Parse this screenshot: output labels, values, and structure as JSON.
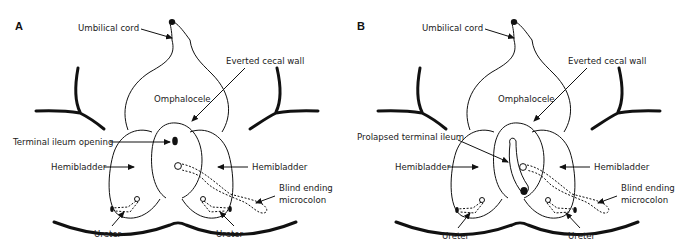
{
  "figure": {
    "type": "anatomical-diagram",
    "panels": [
      {
        "letter": "A",
        "labels": {
          "umbilical_cord": "Umbilical cord",
          "everted_cecal_wall": "Everted cecal wall",
          "omphalocele": "Omphalocele",
          "center_feature": "Terminal ileum opening",
          "hemibladder_left": "Hemibladder",
          "hemibladder_right": "Hemibladder",
          "blind_ending_1": "Blind ending",
          "blind_ending_2": "microcolon",
          "ureter_left": "Ureter",
          "ureter_right": "Ureter"
        }
      },
      {
        "letter": "B",
        "labels": {
          "umbilical_cord": "Umbilical cord",
          "everted_cecal_wall": "Everted cecal wall",
          "omphalocele": "Omphalocele",
          "center_feature": "Prolapsed terminal ileum",
          "hemibladder_left": "Hemibladder",
          "hemibladder_right": "Hemibladder",
          "blind_ending_1": "Blind ending",
          "blind_ending_2": "microcolon",
          "ureter_left": "Ureter",
          "ureter_right": "Ureter"
        }
      }
    ],
    "colors": {
      "line": "#111111",
      "background": "#ffffff"
    }
  }
}
